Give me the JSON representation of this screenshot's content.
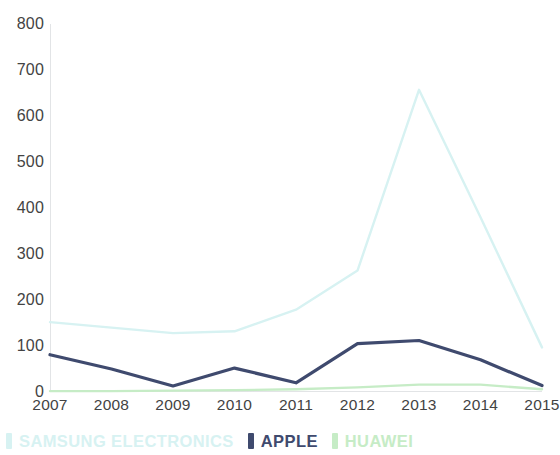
{
  "chart_data": {
    "type": "line",
    "title": "",
    "subtitle": "",
    "xlabel": "",
    "ylabel": "",
    "categories": [
      "2007",
      "2008",
      "2009",
      "2010",
      "2011",
      "2012",
      "2013",
      "2014",
      "2015"
    ],
    "x": [
      2007,
      2008,
      2009,
      2010,
      2011,
      2012,
      2013,
      2014,
      2015
    ],
    "xlim": [
      2007,
      2015
    ],
    "ylim": [
      0,
      800
    ],
    "y_ticks": [
      0,
      100,
      200,
      300,
      400,
      500,
      600,
      700,
      800
    ],
    "x_ticks": [
      "2007",
      "2008",
      "2009",
      "2010",
      "2011",
      "2012",
      "2013",
      "2014",
      "2015"
    ],
    "grid": false,
    "legend_position": "bottom",
    "series": [
      {
        "name": "SAMSUNG ELECTRONICS",
        "color": "#d7f2f2",
        "values": [
          152,
          140,
          128,
          132,
          179,
          264,
          657,
          380,
          97
        ]
      },
      {
        "name": "APPLE",
        "color": "#3f4a6e",
        "values": [
          81,
          50,
          13,
          52,
          20,
          105,
          112,
          70,
          14
        ]
      },
      {
        "name": "HUAWEI",
        "color": "#c6ecc6",
        "values": [
          2,
          2,
          3,
          4,
          6,
          10,
          16,
          16,
          6
        ]
      }
    ],
    "annotations": []
  },
  "axis": {
    "y_tick_labels": [
      "800",
      "700",
      "600",
      "500",
      "400",
      "300",
      "200",
      "100",
      "0"
    ],
    "x_tick_labels": [
      "2007",
      "2008",
      "2009",
      "2010",
      "2011",
      "2012",
      "2013",
      "2014",
      "2015"
    ]
  },
  "legend": {
    "entries": [
      {
        "label": "SAMSUNG ELECTRONICS",
        "color": "#d7f2f2"
      },
      {
        "label": "APPLE",
        "color": "#3f4a6e"
      },
      {
        "label": "HUAWEI",
        "color": "#c6ecc6"
      }
    ]
  },
  "colors": {
    "axis_line": "#e2e4e6",
    "tick_text": "#434343",
    "background": "#ffffff"
  }
}
